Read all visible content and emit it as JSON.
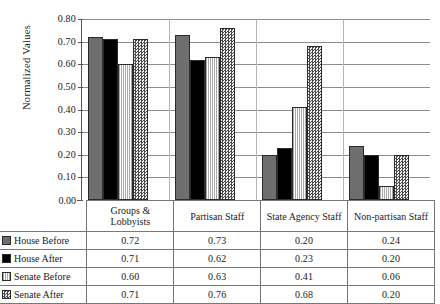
{
  "chart_data": {
    "type": "bar",
    "title": "",
    "xlabel": "",
    "ylabel": "Normalized Values",
    "ylim": [
      0.0,
      0.8
    ],
    "grid": true,
    "legend_position": "table-left",
    "y_ticks": [
      "0.80",
      "0.70",
      "0.60",
      "0.50",
      "0.40",
      "0.30",
      "0.20",
      "0.10",
      "0.00"
    ],
    "y_tick_values": [
      0.8,
      0.7,
      0.6,
      0.5,
      0.4,
      0.3,
      0.2,
      0.1,
      0.0
    ],
    "categories": [
      "Groups & Lobbyists",
      "Partisan Staff",
      "State Agency Staff",
      "Non-partisan Staff"
    ],
    "category_labels": [
      [
        "Groups &",
        "Lobbyists"
      ],
      [
        "Partisan Staff"
      ],
      [
        "State Agency Staff"
      ],
      [
        "Non-partisan Staff"
      ]
    ],
    "series": [
      {
        "name": "House Before",
        "fill": "fill-house-before",
        "color": "#6e6e6e",
        "values": [
          0.72,
          0.73,
          0.2,
          0.24
        ],
        "labels": [
          "0.72",
          "0.73",
          "0.20",
          "0.24"
        ]
      },
      {
        "name": "House After",
        "fill": "fill-house-after",
        "color": "#000000",
        "values": [
          0.71,
          0.62,
          0.23,
          0.2
        ],
        "labels": [
          "0.71",
          "0.62",
          "0.23",
          "0.20"
        ]
      },
      {
        "name": "Senate Before",
        "fill": "fill-senate-before",
        "color": "#f4f4f4",
        "values": [
          0.6,
          0.63,
          0.41,
          0.06
        ],
        "labels": [
          "0.60",
          "0.63",
          "0.41",
          "0.06"
        ]
      },
      {
        "name": "Senate After",
        "fill": "fill-senate-after",
        "color": "#e8e8e8",
        "values": [
          0.71,
          0.76,
          0.68,
          0.2
        ],
        "labels": [
          "0.71",
          "0.76",
          "0.68",
          "0.20"
        ]
      }
    ]
  }
}
